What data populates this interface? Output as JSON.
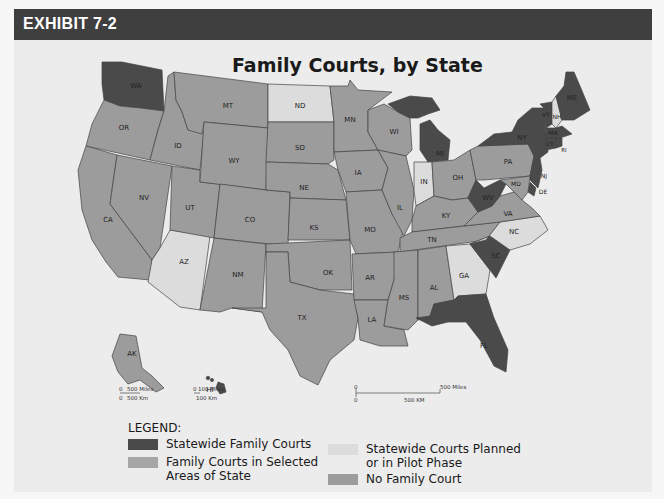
{
  "header": {
    "title": "EXHIBIT 7-2"
  },
  "map": {
    "title": "Family Courts, by State",
    "colors": {
      "statewide": "#4a4a4a",
      "selected_areas": "#a6a6a6",
      "planned_pilot": "#dcdcdc",
      "none": "#9c9c9c"
    },
    "states": {
      "WA": "statewide",
      "OR": "none",
      "CA": "none",
      "ID": "none",
      "NV": "none",
      "AZ": "planned_pilot",
      "MT": "none",
      "WY": "none",
      "UT": "none",
      "CO": "none",
      "NM": "none",
      "ND": "planned_pilot",
      "SD": "none",
      "NE": "none",
      "KS": "none",
      "OK": "none",
      "TX": "none",
      "MN": "none",
      "IA": "none",
      "MO": "none",
      "AR": "none",
      "LA": "none",
      "WI": "none",
      "IL": "none",
      "MI": "statewide",
      "IN": "planned_pilot",
      "OH": "none",
      "KY": "none",
      "TN": "none",
      "MS": "none",
      "AL": "none",
      "GA": "planned_pilot",
      "FL": "statewide",
      "SC": "statewide",
      "NC": "planned_pilot",
      "VA": "none",
      "WV": "statewide",
      "PA": "none",
      "NY": "statewide",
      "VT": "statewide",
      "NH": "planned_pilot",
      "ME": "statewide",
      "MA": "statewide",
      "CT": "statewide",
      "RI": "statewide",
      "NJ": "statewide",
      "DE": "statewide",
      "MD": "none",
      "AK": "none",
      "HI": "statewide"
    },
    "inset_scales": {
      "alaska": {
        "miles": "500 Miles",
        "km": "500 Km",
        "zero": "0"
      },
      "hawaii": {
        "miles": "100 Miles",
        "km": "100 Km",
        "zero": "0"
      },
      "mainland": {
        "miles": "500 Miles",
        "km": "500 KM",
        "zero": "0"
      }
    }
  },
  "legend": {
    "title": "LEGEND:",
    "items": [
      {
        "key": "statewide",
        "label": "Statewide Family Courts"
      },
      {
        "key": "selected_areas",
        "label": "Family Courts in Selected Areas of State"
      },
      {
        "key": "planned_pilot",
        "label": "Statewide Courts Planned or in Pilot Phase"
      },
      {
        "key": "none",
        "label": "No Family Court"
      }
    ]
  }
}
